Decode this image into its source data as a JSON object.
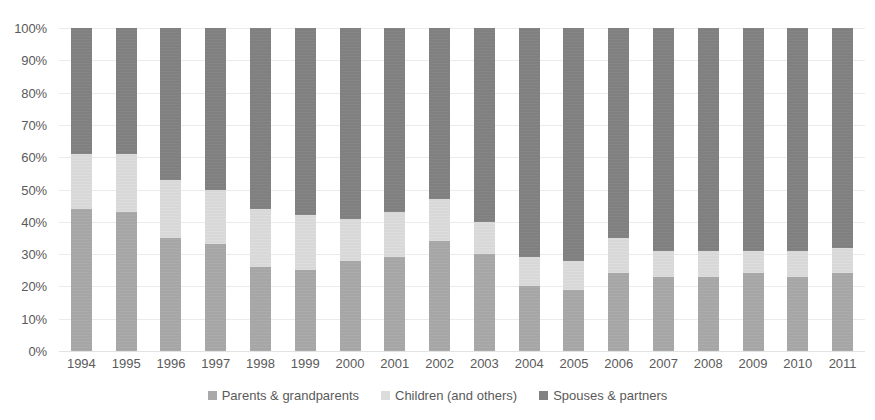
{
  "chart_data": {
    "type": "bar",
    "subtype": "100% stacked column",
    "title": "",
    "subtitle": "",
    "xlabel": "",
    "ylabel": "",
    "grid": true,
    "legend_position": "bottom",
    "ylim": [
      0,
      100
    ],
    "y_ticks": [
      "0%",
      "10%",
      "20%",
      "30%",
      "40%",
      "50%",
      "60%",
      "70%",
      "80%",
      "90%",
      "100%"
    ],
    "y_tick_values": [
      0,
      10,
      20,
      30,
      40,
      50,
      60,
      70,
      80,
      90,
      100
    ],
    "categories": [
      "1994",
      "1995",
      "1996",
      "1997",
      "1998",
      "1999",
      "2000",
      "2001",
      "2002",
      "2003",
      "2004",
      "2005",
      "2006",
      "2007",
      "2008",
      "2009",
      "2010",
      "2011"
    ],
    "series": [
      {
        "name": "Parents & grandparents",
        "color": "#a9a9a9",
        "values": [
          44,
          43,
          35,
          33,
          26,
          25,
          28,
          29,
          34,
          30,
          20,
          19,
          24,
          23,
          23,
          24,
          23,
          24
        ]
      },
      {
        "name": "Children (and others)",
        "color": "#dcdcdc",
        "values": [
          17,
          18,
          18,
          17,
          18,
          17,
          13,
          14,
          13,
          10,
          9,
          9,
          11,
          8,
          8,
          7,
          8,
          8
        ]
      },
      {
        "name": "Spouses & partners",
        "color": "#828282",
        "values": [
          39,
          39,
          47,
          50,
          56,
          58,
          59,
          57,
          53,
          60,
          71,
          72,
          65,
          69,
          69,
          69,
          69,
          68
        ]
      }
    ]
  },
  "legend": {
    "items": [
      {
        "label": "Parents & grandparents",
        "color": "#a9a9a9"
      },
      {
        "label": "Children (and others)",
        "color": "#dcdcdc"
      },
      {
        "label": "Spouses & partners",
        "color": "#828282"
      }
    ]
  }
}
